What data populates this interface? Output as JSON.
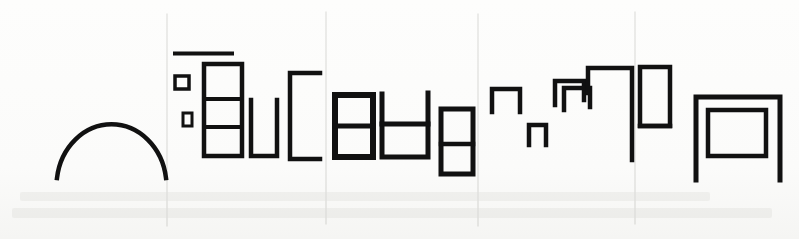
{
  "artwork": {
    "title": "Abstract line-drawing of rectilinear architectural forms",
    "medium": "scanned ink line drawing on white paper",
    "width": 799,
    "height": 239,
    "background_color": "#fdfdfc",
    "ink_color": "#111111",
    "divider_color": "#e3e3e1",
    "smudge_color": "#f1f1ef",
    "panel_count": 5
  },
  "dividers": [
    {
      "name": "divider-1",
      "x": 167,
      "y1": 14,
      "y2": 226
    },
    {
      "name": "divider-2",
      "x": 326,
      "y1": 12,
      "y2": 224
    },
    {
      "name": "divider-3",
      "x": 478,
      "y1": 14,
      "y2": 226
    },
    {
      "name": "divider-4",
      "x": 635,
      "y1": 12,
      "y2": 224
    }
  ],
  "panels": [
    {
      "id": "panel-1",
      "label": "Arch panel",
      "x_range": [
        0,
        167
      ],
      "shapes": [
        {
          "name": "semicircular-arch",
          "type": "arch",
          "stroke": 4.5,
          "path": "M 57 178 A 55 62 0 0 1 166 178"
        }
      ]
    },
    {
      "id": "panel-2",
      "label": "Stacked rectangles panel",
      "x_range": [
        167,
        326
      ],
      "shapes": [
        {
          "name": "horizontal-rule-bar",
          "type": "line",
          "x1": 175,
          "y1": 53.5,
          "x2": 232,
          "y2": 53.5,
          "stroke": 4
        },
        {
          "name": "small-square-upper",
          "type": "rect",
          "x": 175,
          "y": 76,
          "w": 14,
          "h": 13,
          "stroke": 3.5
        },
        {
          "name": "small-square-lower",
          "type": "rect",
          "x": 183,
          "y": 113,
          "w": 9,
          "h": 13,
          "stroke": 3
        },
        {
          "name": "three-cell-tower",
          "type": "rect",
          "x": 204,
          "y": 64,
          "w": 38,
          "h": 92,
          "stroke": 4.5
        },
        {
          "name": "tower-divider-upper",
          "type": "line",
          "x1": 204,
          "y1": 99,
          "x2": 242,
          "y2": 99,
          "stroke": 4
        },
        {
          "name": "tower-divider-lower",
          "type": "line",
          "x1": 204,
          "y1": 127,
          "x2": 242,
          "y2": 127,
          "stroke": 4
        },
        {
          "name": "u-shape-open-top",
          "type": "path",
          "d": "M 251 100 L 251 156 L 277 156 L 277 100",
          "stroke": 4.5
        },
        {
          "name": "bracket-open-right",
          "type": "path",
          "d": "M 320 73 L 290 73 L 290 159 L 320 159",
          "stroke": 4.5
        }
      ]
    },
    {
      "id": "panel-3",
      "label": "Two-cell boxes panel",
      "x_range": [
        326,
        478
      ],
      "shapes": [
        {
          "name": "two-cell-box-left",
          "type": "rect",
          "x": 335,
          "y": 95,
          "w": 38,
          "h": 62,
          "stroke": 6
        },
        {
          "name": "two-cell-box-left-divider",
          "type": "line",
          "x1": 335,
          "y1": 126,
          "x2": 373,
          "y2": 126,
          "stroke": 5
        },
        {
          "name": "h-bar-shape",
          "type": "path",
          "d": "M 382 94 L 382 157 L 428 157 L 428 93",
          "stroke": 5
        },
        {
          "name": "h-bar-crossbar",
          "type": "line",
          "x1": 382,
          "y1": 124,
          "x2": 428,
          "y2": 124,
          "stroke": 5
        },
        {
          "name": "two-cell-box-right",
          "type": "rect",
          "x": 441,
          "y": 109,
          "w": 32,
          "h": 65,
          "stroke": 5
        },
        {
          "name": "two-cell-box-right-divider",
          "type": "line",
          "x1": 441,
          "y1": 144,
          "x2": 473,
          "y2": 144,
          "stroke": 4.5
        }
      ]
    },
    {
      "id": "panel-4",
      "label": "Stepped inverted-U panel",
      "x_range": [
        478,
        635
      ],
      "shapes": [
        {
          "name": "inverted-u-small",
          "type": "path",
          "d": "M 492 112 L 492 89 L 520 89 L 520 112",
          "stroke": 4.5
        },
        {
          "name": "inverted-u-tiny",
          "type": "path",
          "d": "M 529 145 L 529 125 L 546 125 L 546 145",
          "stroke": 4.5
        },
        {
          "name": "inverted-u-medium",
          "type": "path",
          "d": "M 555 105 L 555 81 L 584 81 L 584 100",
          "stroke": 4.5
        },
        {
          "name": "inverted-u-medium-inner",
          "type": "path",
          "d": "M 564 110 L 564 88 L 590 88 L 590 107",
          "stroke": 4.5
        },
        {
          "name": "inverted-u-large",
          "type": "path",
          "d": "M 588 93 L 588 68 L 632 68 L 632 160",
          "stroke": 4.5
        }
      ]
    },
    {
      "id": "panel-5",
      "label": "Table form panel",
      "x_range": [
        635,
        799
      ],
      "shapes": [
        {
          "name": "narrow-upright-box",
          "type": "path",
          "d": "M 640 126 L 640 67 L 670 67 L 670 126 L 640 126",
          "stroke": 4.5
        },
        {
          "name": "narrow-box-foot",
          "type": "line",
          "x1": 640,
          "y1": 126,
          "x2": 670,
          "y2": 126,
          "stroke": 4.5
        },
        {
          "name": "table-outer-frame",
          "type": "path",
          "d": "M 696 180 L 696 97 L 780 97 L 780 180",
          "stroke": 5
        },
        {
          "name": "table-inner-frame",
          "type": "path",
          "d": "M 708 156 L 708 110 L 766 110 L 766 156 L 708 156",
          "stroke": 4.5
        }
      ]
    }
  ],
  "bottom_smudges": [
    {
      "name": "smudge-row-upper",
      "x": 20,
      "y": 192,
      "w": 690,
      "h": 9
    },
    {
      "name": "smudge-row-lower",
      "x": 12,
      "y": 208,
      "w": 760,
      "h": 10
    }
  ],
  "chart_data": {
    "type": "table",
    "xlabel": "",
    "ylabel": "",
    "categories": [
      "panel-1",
      "panel-2",
      "panel-3",
      "panel-4",
      "panel-5"
    ],
    "values": [
      1,
      8,
      6,
      5,
      4
    ],
    "series": [
      {
        "name": "shapes per panel",
        "values": [
          1,
          8,
          6,
          5,
          4
        ]
      }
    ],
    "annotations": [
      "panel-1: single semicircular arch",
      "panel-2: rule bar, two small squares, three-cell tower, open-top U, open-right bracket",
      "panel-3: two-cell box, H-bar form, two-cell box",
      "panel-4: four stepped inverted-U forms ascending left to right",
      "panel-5: narrow upright box and nested table form"
    ],
    "legend_position": "none",
    "grid": false
  }
}
